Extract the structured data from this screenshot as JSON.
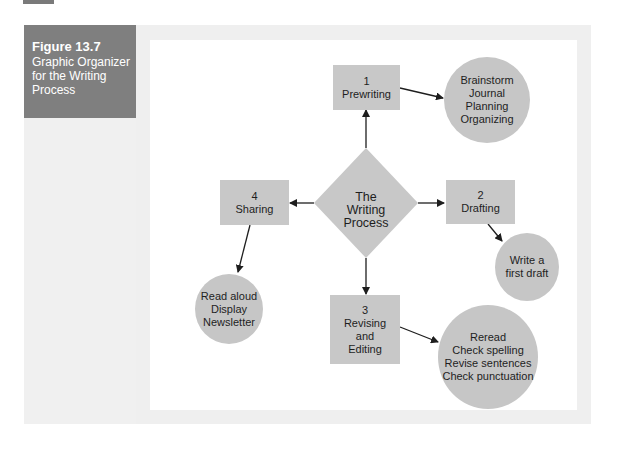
{
  "figure": {
    "number": "Figure 13.7",
    "title": "Graphic Organizer for the Writing Process"
  },
  "center": {
    "lines": [
      "The",
      "Writing",
      "Process"
    ]
  },
  "steps": [
    {
      "number": "1",
      "label": "Prewriting",
      "details": [
        "Brainstorm",
        "Journal",
        "Planning",
        "Organizing"
      ]
    },
    {
      "number": "2",
      "label": "Drafting",
      "details": [
        "Write a",
        "first draft"
      ]
    },
    {
      "number": "3",
      "label": "Revising and Editing",
      "label_lines": [
        "Revising",
        "and",
        "Editing"
      ],
      "details": [
        "Reread",
        "Check spelling",
        "Revise sentences",
        "Check punctuation"
      ]
    },
    {
      "number": "4",
      "label": "Sharing",
      "details": [
        "Read aloud",
        "Display",
        "Newsletter"
      ]
    }
  ],
  "colors": {
    "caption_bg": "#7f7f7f",
    "frame_bg": "#efefef",
    "node_fill": "#c8c8c8",
    "arrow": "#1e1e1e"
  }
}
